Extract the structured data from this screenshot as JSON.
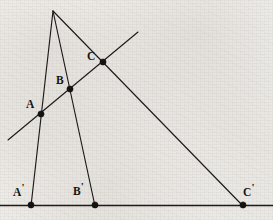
{
  "figure": {
    "canvas": {
      "width": 273,
      "height": 220
    },
    "background_color": "#f2f0ec",
    "ink_color": "#1c1b1a",
    "point_color": "#141312"
  },
  "points": {
    "vertex": {
      "name": "vertex",
      "label": "",
      "x": 53,
      "y": 11,
      "marker": false
    },
    "A": {
      "name": "A",
      "label": "A",
      "prime": "",
      "x": 41,
      "y": 114,
      "marker": true,
      "label_x": 26,
      "label_y": 99
    },
    "B": {
      "name": "B",
      "label": "B",
      "prime": "",
      "x": 70,
      "y": 89,
      "marker": true,
      "label_x": 56,
      "label_y": 75
    },
    "C": {
      "name": "C",
      "label": "C",
      "prime": "",
      "x": 103,
      "y": 62,
      "marker": true,
      "label_x": 87,
      "label_y": 51
    },
    "Ap": {
      "name": "A'",
      "label": "A",
      "prime": "'",
      "x": 31,
      "y": 205,
      "marker": true,
      "label_x": 13,
      "label_y": 187
    },
    "Bp": {
      "name": "B'",
      "label": "B",
      "prime": "'",
      "x": 95,
      "y": 205,
      "marker": true,
      "label_x": 73,
      "label_y": 186
    },
    "Cp": {
      "name": "C'",
      "label": "C",
      "prime": "'",
      "x": 243,
      "y": 205,
      "marker": true,
      "label_x": 243,
      "label_y": 187
    }
  },
  "lines": {
    "ray_a": {
      "name": "ray-vertex-to-A-prime",
      "x1": 53,
      "y1": 11,
      "x2": 31,
      "y2": 206,
      "width": 1.15
    },
    "ray_b": {
      "name": "ray-vertex-to-B-prime",
      "x1": 53,
      "y1": 11,
      "x2": 95,
      "y2": 206,
      "width": 1.15
    },
    "ray_c": {
      "name": "ray-vertex-to-C-prime",
      "x1": 53,
      "y1": 11,
      "x2": 243,
      "y2": 206,
      "width": 1.15
    },
    "transversal": {
      "name": "transversal-through-A-B-C",
      "x1": 8,
      "y1": 140,
      "x2": 138,
      "y2": 32,
      "width": 1.15
    },
    "base_line": {
      "name": "base-line-through-A-prime-B-prime-C-prime",
      "x1": 0,
      "y1": 205.5,
      "x2": 273,
      "y2": 205.5,
      "width": 1.3
    }
  },
  "marker_radius": 3.1
}
